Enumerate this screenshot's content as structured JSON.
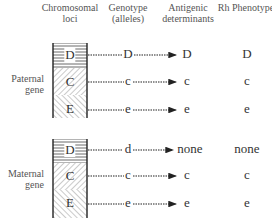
{
  "headers": {
    "loci": "Chromosomal loci",
    "genotype": "Genotype (alleles)",
    "antigenic": "Antigenic determinants",
    "rh": "Rh Phenotype"
  },
  "groups": [
    {
      "label": "Paternal gene",
      "rows": [
        {
          "locus": "D",
          "allele": "D",
          "antigen": "D",
          "phenotype": "D"
        },
        {
          "locus": "C",
          "allele": "c",
          "antigen": "c",
          "phenotype": "c"
        },
        {
          "locus": "E",
          "allele": "e",
          "antigen": "e",
          "phenotype": "e"
        }
      ]
    },
    {
      "label": "Maternal gene",
      "rows": [
        {
          "locus": "D",
          "allele": "d",
          "antigen": "none",
          "phenotype": "none"
        },
        {
          "locus": "C",
          "allele": "c",
          "antigen": "c",
          "phenotype": "c"
        },
        {
          "locus": "E",
          "allele": "e",
          "antigen": "e",
          "phenotype": "e"
        }
      ]
    }
  ]
}
